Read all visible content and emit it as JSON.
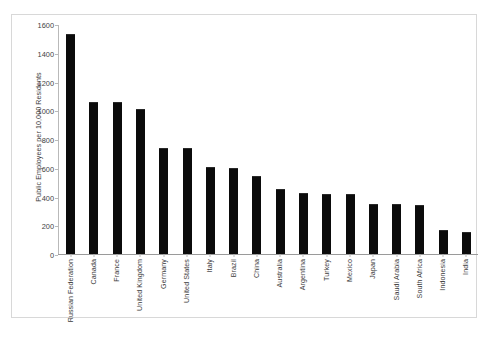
{
  "chart_data": {
    "type": "bar",
    "title": "",
    "xlabel": "",
    "ylabel": "Public Employees per 10,000 Residents",
    "ylim": [
      0,
      1600
    ],
    "ytick_values": [
      0,
      200,
      400,
      600,
      800,
      1000,
      1200,
      1400,
      1600
    ],
    "ytick_labels": [
      "0",
      "200",
      "400",
      "600",
      "800",
      "1000",
      "1200",
      "1400",
      "1600"
    ],
    "grid": false,
    "legend": null,
    "bar_color": "#0b0b0b",
    "categories": [
      "Russian Federation",
      "Canada",
      "France",
      "United Kingdom",
      "Germany",
      "United States",
      "Italy",
      "Brazil",
      "China",
      "Australia",
      "Argentina",
      "Turkey",
      "Mexico",
      "Japan",
      "Saudi Arabia",
      "South Africa",
      "Indonesia",
      "India"
    ],
    "values": [
      1530,
      1055,
      1055,
      1010,
      735,
      735,
      605,
      595,
      540,
      455,
      425,
      420,
      415,
      350,
      345,
      340,
      165,
      155
    ]
  }
}
